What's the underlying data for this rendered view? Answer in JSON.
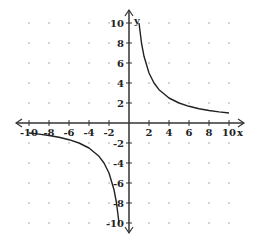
{
  "chart_data": {
    "type": "line",
    "title": "",
    "xlabel": "x",
    "ylabel": "y",
    "xlim": [
      -10,
      10
    ],
    "ylim": [
      -10,
      10
    ],
    "grid": "dotted",
    "x_ticks": [
      -10,
      -8,
      -6,
      -4,
      -2,
      2,
      4,
      6,
      8,
      10
    ],
    "y_ticks": [
      10,
      8,
      6,
      4,
      2,
      -2,
      -4,
      -6,
      -8,
      -10
    ],
    "x_tick_labels": [
      "-10",
      "-8",
      "-6",
      "-4",
      "-2",
      "2",
      "4",
      "6",
      "8",
      "10"
    ],
    "y_tick_labels": [
      "10",
      "8",
      "6",
      "4",
      "2",
      "-2",
      "-4",
      "-6",
      "-8",
      "-10"
    ],
    "series": [
      {
        "name": "y = 10/x (x > 0 branch)",
        "x": [
          1,
          1.25,
          1.5,
          2,
          2.5,
          3,
          4,
          5,
          6,
          7,
          8,
          9,
          10
        ],
        "y": [
          10,
          8,
          6.67,
          5,
          4,
          3.33,
          2.5,
          2,
          1.67,
          1.43,
          1.25,
          1.11,
          1
        ]
      },
      {
        "name": "y = 10/x (x < 0 branch)",
        "x": [
          -10,
          -9,
          -8,
          -7,
          -6,
          -5,
          -4,
          -3,
          -2.5,
          -2,
          -1.5,
          -1.25,
          -1
        ],
        "y": [
          -1,
          -1.11,
          -1.25,
          -1.43,
          -1.67,
          -2,
          -2.5,
          -3.33,
          -4,
          -5,
          -6.67,
          -8,
          -10
        ]
      }
    ]
  },
  "axes": {
    "x_name": "x",
    "y_name": "y"
  }
}
